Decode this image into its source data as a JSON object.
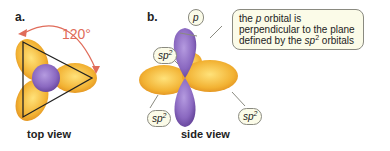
{
  "panel_a": {
    "label": "a.",
    "angle": "120°",
    "caption": "top view"
  },
  "panel_b": {
    "label": "b.",
    "caption": "side view",
    "p_label": "p",
    "sp2_base": "sp",
    "sp2_sup": "2",
    "note_part1": "the ",
    "note_p": "p",
    "note_part2": " orbital is perpendicular to the plane defined by the ",
    "note_sp": "sp",
    "note_sup": "2",
    "note_part3": " orbitals"
  },
  "colors": {
    "orbital_sp2": "#f0b030",
    "orbital_p": "#8e6bbf",
    "angle_arrow": "#e06c5a",
    "bubble_fill": "#fbfbe8"
  }
}
